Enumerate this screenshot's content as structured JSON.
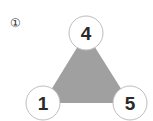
{
  "problem_label": "①",
  "triangle": {
    "fill": "#a0a0a0",
    "nodes": [
      {
        "id": "top",
        "value": "4",
        "cx": 86,
        "cy": 33
      },
      {
        "id": "bottom-left",
        "value": "1",
        "cx": 43,
        "cy": 103
      },
      {
        "id": "bottom-right",
        "value": "5",
        "cx": 130,
        "cy": 103
      }
    ]
  }
}
